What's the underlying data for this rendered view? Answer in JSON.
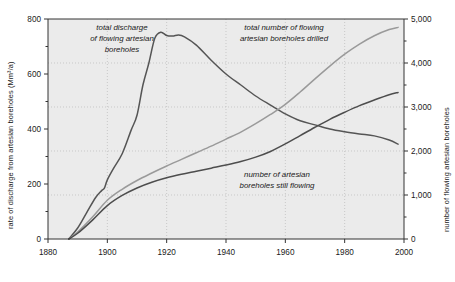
{
  "chart_data": {
    "type": "line",
    "title": "",
    "xlabel": "",
    "ylabel": "rate of discharge from artesian boreholes (Mm³/a)",
    "y2label": "number of flowing artesian boreholes",
    "xlim": [
      1880,
      2000
    ],
    "ylim": [
      0,
      800
    ],
    "y2lim": [
      0,
      5000
    ],
    "xticks": [
      1880,
      1900,
      1920,
      1940,
      1960,
      1980,
      2000
    ],
    "xticklabels": [
      "1880",
      "1900",
      "1920",
      "1940",
      "1960",
      "1980",
      "2000"
    ],
    "yticks": [
      0,
      200,
      400,
      600,
      800
    ],
    "yticklabels": [
      "0",
      "200",
      "400",
      "600",
      "800"
    ],
    "yminorticks": [
      100,
      300,
      500,
      700
    ],
    "y2ticks": [
      0,
      1000,
      2000,
      3000,
      4000,
      5000
    ],
    "y2ticklabels": [
      "0",
      "1,000",
      "2,000",
      "3,000",
      "4,000",
      "5,000"
    ],
    "y2minorticks": [
      500,
      1500,
      2500,
      3500,
      4500
    ],
    "grid": true,
    "grid_color": "#b9b9b9",
    "plot_bg": "#ebebeb",
    "legend": "inline-annotations",
    "series": [
      {
        "name": "total discharge of flowing artesian boreholes",
        "axis": "left",
        "color": "#555555",
        "annotation": "total discharge\nof flowing artesian\nboreholes",
        "x": [
          1887,
          1890,
          1893,
          1896,
          1898,
          1899,
          1900,
          1902,
          1905,
          1908,
          1910,
          1912,
          1914,
          1916,
          1918,
          1920,
          1922,
          1924,
          1926,
          1930,
          1935,
          1940,
          1945,
          1950,
          1955,
          1960,
          1965,
          1970,
          1975,
          1980,
          1985,
          1990,
          1995,
          1998
        ],
        "y": [
          0,
          40,
          95,
          150,
          175,
          185,
          215,
          255,
          310,
          395,
          450,
          560,
          640,
          730,
          752,
          740,
          738,
          742,
          735,
          705,
          650,
          600,
          560,
          520,
          487,
          455,
          430,
          415,
          400,
          390,
          382,
          375,
          360,
          345
        ]
      },
      {
        "name": "total number of flowing artesian boreholes drilled",
        "axis": "right",
        "color": "#9a9a9a",
        "annotation": "total number of flowing\nartesian boreholes drilled",
        "x": [
          1887,
          1890,
          1895,
          1900,
          1905,
          1910,
          1915,
          1920,
          1925,
          1930,
          1935,
          1940,
          1945,
          1950,
          1955,
          1960,
          1965,
          1970,
          1975,
          1980,
          1985,
          1990,
          1995,
          1998
        ],
        "y": [
          0,
          160,
          500,
          880,
          1130,
          1330,
          1500,
          1660,
          1810,
          1960,
          2110,
          2270,
          2430,
          2620,
          2830,
          3060,
          3340,
          3640,
          3930,
          4200,
          4430,
          4620,
          4760,
          4810
        ]
      },
      {
        "name": "number of artesian boreholes still flowing",
        "axis": "right",
        "color": "#4d4d4d",
        "annotation": "number of artesian\nboreholes still flowing",
        "x": [
          1887,
          1890,
          1895,
          1900,
          1905,
          1910,
          1915,
          1920,
          1925,
          1930,
          1935,
          1940,
          1945,
          1950,
          1955,
          1960,
          1965,
          1970,
          1975,
          1980,
          1985,
          1990,
          1995,
          1998
        ],
        "y": [
          0,
          130,
          430,
          760,
          990,
          1160,
          1290,
          1390,
          1470,
          1540,
          1610,
          1680,
          1760,
          1860,
          1990,
          2160,
          2350,
          2540,
          2720,
          2880,
          3030,
          3160,
          3280,
          3330
        ]
      }
    ]
  },
  "annotations": {
    "discharge": {
      "line1": "total discharge",
      "line2": "of flowing artesian",
      "line3": "boreholes"
    },
    "drilled": {
      "line1": "total number of flowing",
      "line2": "artesian boreholes drilled"
    },
    "still_flowing": {
      "line1": "number of artesian",
      "line2": "boreholes still flowing"
    }
  },
  "axes": {
    "left_title": "rate of discharge from artesian boreholes (Mm³/a)",
    "right_title": "number of flowing artesian boreholes"
  }
}
